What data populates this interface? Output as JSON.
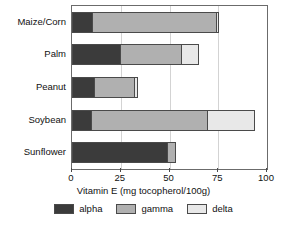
{
  "chart_data": {
    "type": "bar",
    "orientation": "horizontal",
    "stacked": true,
    "title": "",
    "subtitle": "",
    "xlabel": "Vitamin E (mg tocopherol/100g)",
    "ylabel": "",
    "xlim": [
      0,
      100
    ],
    "xticks": [
      0,
      25,
      50,
      75,
      100
    ],
    "xtick_labels": [
      "0",
      "25",
      "50",
      "75",
      "100"
    ],
    "grid": "vertical",
    "legend_position": "bottom",
    "categories": [
      "Maize/Corn",
      "Palm",
      "Peanut",
      "Soybean",
      "Sunflower"
    ],
    "series": [
      {
        "name": "alpha",
        "color": "#3b3b3b",
        "values": [
          11,
          25,
          12,
          10,
          49
        ]
      },
      {
        "name": "gamma",
        "color": "#b0b0b0",
        "values": [
          64,
          32,
          21,
          60,
          5
        ]
      },
      {
        "name": "delta",
        "color": "#e8e8e8",
        "values": [
          1.5,
          9,
          2,
          25,
          0
        ]
      }
    ],
    "totals": [
      76.5,
      66,
      35,
      95,
      54
    ]
  },
  "legend": {
    "entries": [
      {
        "label": "alpha"
      },
      {
        "label": "gamma"
      },
      {
        "label": "delta"
      }
    ]
  }
}
